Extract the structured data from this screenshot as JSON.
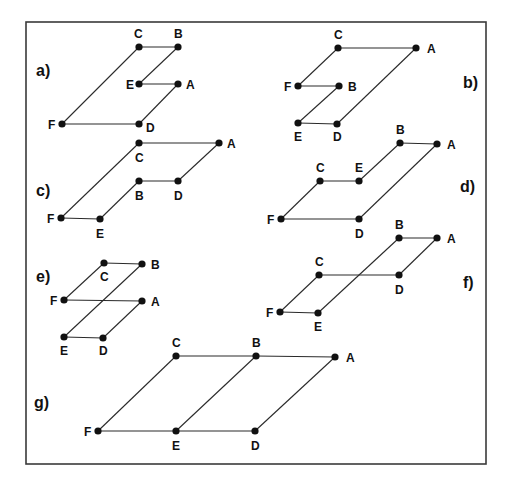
{
  "figure": {
    "frame": {
      "x": 26,
      "y": 22,
      "width": 460,
      "height": 442
    },
    "panels": [
      {
        "id": "a",
        "label": "a)",
        "label_pos": [
          36,
          76
        ],
        "nodes": [
          {
            "id": "C",
            "x": 139,
            "y": 47,
            "lx": 134,
            "ly": 38
          },
          {
            "id": "B",
            "x": 178,
            "y": 47,
            "lx": 174,
            "ly": 38
          },
          {
            "id": "E",
            "x": 139,
            "y": 84,
            "lx": 126,
            "ly": 89
          },
          {
            "id": "A",
            "x": 178,
            "y": 84,
            "lx": 186,
            "ly": 89
          },
          {
            "id": "F",
            "x": 62,
            "y": 124,
            "lx": 48,
            "ly": 129
          },
          {
            "id": "D",
            "x": 139,
            "y": 124,
            "lx": 146,
            "ly": 132
          }
        ],
        "edges": [
          [
            "C",
            "B"
          ],
          [
            "B",
            "E"
          ],
          [
            "E",
            "A"
          ],
          [
            "A",
            "D"
          ],
          [
            "F",
            "D"
          ],
          [
            "F",
            "C"
          ]
        ]
      },
      {
        "id": "b",
        "label": "b)",
        "label_pos": [
          463,
          88
        ],
        "nodes": [
          {
            "id": "C",
            "x": 338,
            "y": 48,
            "lx": 334,
            "ly": 39
          },
          {
            "id": "A",
            "x": 416,
            "y": 48,
            "lx": 427,
            "ly": 53
          },
          {
            "id": "F",
            "x": 298,
            "y": 86,
            "lx": 284,
            "ly": 91
          },
          {
            "id": "B",
            "x": 339,
            "y": 86,
            "lx": 348,
            "ly": 91
          },
          {
            "id": "E",
            "x": 298,
            "y": 123,
            "lx": 294,
            "ly": 141
          },
          {
            "id": "D",
            "x": 337,
            "y": 124,
            "lx": 333,
            "ly": 141
          }
        ],
        "edges": [
          [
            "C",
            "A"
          ],
          [
            "F",
            "C"
          ],
          [
            "F",
            "B"
          ],
          [
            "B",
            "E"
          ],
          [
            "E",
            "D"
          ],
          [
            "D",
            "A"
          ]
        ]
      },
      {
        "id": "c",
        "label": "c)",
        "label_pos": [
          36,
          196
        ],
        "nodes": [
          {
            "id": "C",
            "x": 139,
            "y": 143,
            "lx": 135,
            "ly": 162
          },
          {
            "id": "A",
            "x": 219,
            "y": 143,
            "lx": 227,
            "ly": 148
          },
          {
            "id": "B",
            "x": 139,
            "y": 181,
            "lx": 135,
            "ly": 200
          },
          {
            "id": "D",
            "x": 178,
            "y": 181,
            "lx": 174,
            "ly": 200
          },
          {
            "id": "F",
            "x": 61,
            "y": 218,
            "lx": 47,
            "ly": 223
          },
          {
            "id": "E",
            "x": 100,
            "y": 219,
            "lx": 96,
            "ly": 238
          }
        ],
        "edges": [
          [
            "C",
            "A"
          ],
          [
            "F",
            "C"
          ],
          [
            "B",
            "D"
          ],
          [
            "D",
            "A"
          ],
          [
            "F",
            "E"
          ],
          [
            "E",
            "B"
          ]
        ]
      },
      {
        "id": "d",
        "label": "d)",
        "label_pos": [
          460,
          192
        ],
        "nodes": [
          {
            "id": "B",
            "x": 400,
            "y": 143,
            "lx": 396,
            "ly": 134
          },
          {
            "id": "A",
            "x": 437,
            "y": 144,
            "lx": 447,
            "ly": 149
          },
          {
            "id": "C",
            "x": 320,
            "y": 181,
            "lx": 316,
            "ly": 172
          },
          {
            "id": "E",
            "x": 359,
            "y": 181,
            "lx": 355,
            "ly": 172
          },
          {
            "id": "F",
            "x": 281,
            "y": 219,
            "lx": 267,
            "ly": 224
          },
          {
            "id": "D",
            "x": 359,
            "y": 219,
            "lx": 355,
            "ly": 238
          }
        ],
        "edges": [
          [
            "B",
            "A"
          ],
          [
            "C",
            "E"
          ],
          [
            "E",
            "B"
          ],
          [
            "F",
            "C"
          ],
          [
            "F",
            "D"
          ],
          [
            "D",
            "A"
          ]
        ]
      },
      {
        "id": "e",
        "label": "e)",
        "label_pos": [
          36,
          282
        ],
        "nodes": [
          {
            "id": "C",
            "x": 104,
            "y": 263,
            "lx": 100,
            "ly": 281
          },
          {
            "id": "B",
            "x": 142,
            "y": 264,
            "lx": 151,
            "ly": 269
          },
          {
            "id": "F",
            "x": 64,
            "y": 300,
            "lx": 50,
            "ly": 305
          },
          {
            "id": "A",
            "x": 142,
            "y": 301,
            "lx": 151,
            "ly": 306
          },
          {
            "id": "E",
            "x": 64,
            "y": 337,
            "lx": 60,
            "ly": 355
          },
          {
            "id": "D",
            "x": 103,
            "y": 338,
            "lx": 99,
            "ly": 355
          }
        ],
        "edges": [
          [
            "C",
            "B"
          ],
          [
            "F",
            "C"
          ],
          [
            "F",
            "A"
          ],
          [
            "B",
            "E"
          ],
          [
            "E",
            "D"
          ],
          [
            "D",
            "A"
          ]
        ]
      },
      {
        "id": "f",
        "label": "f)",
        "label_pos": [
          463,
          288
        ],
        "nodes": [
          {
            "id": "B",
            "x": 399,
            "y": 238,
            "lx": 395,
            "ly": 229
          },
          {
            "id": "A",
            "x": 437,
            "y": 238,
            "lx": 447,
            "ly": 243
          },
          {
            "id": "C",
            "x": 319,
            "y": 275,
            "lx": 315,
            "ly": 266
          },
          {
            "id": "D",
            "x": 399,
            "y": 275,
            "lx": 395,
            "ly": 294
          },
          {
            "id": "F",
            "x": 280,
            "y": 312,
            "lx": 266,
            "ly": 317
          },
          {
            "id": "E",
            "x": 318,
            "y": 313,
            "lx": 314,
            "ly": 331
          }
        ],
        "edges": [
          [
            "B",
            "A"
          ],
          [
            "A",
            "D"
          ],
          [
            "C",
            "D"
          ],
          [
            "F",
            "C"
          ],
          [
            "F",
            "E"
          ],
          [
            "E",
            "B"
          ]
        ]
      },
      {
        "id": "g",
        "label": "g)",
        "label_pos": [
          34,
          408
        ],
        "nodes": [
          {
            "id": "C",
            "x": 176,
            "y": 356,
            "lx": 172,
            "ly": 347
          },
          {
            "id": "B",
            "x": 256,
            "y": 356,
            "lx": 252,
            "ly": 347
          },
          {
            "id": "A",
            "x": 335,
            "y": 357,
            "lx": 346,
            "ly": 362
          },
          {
            "id": "F",
            "x": 98,
            "y": 431,
            "lx": 84,
            "ly": 436
          },
          {
            "id": "E",
            "x": 176,
            "y": 431,
            "lx": 172,
            "ly": 450
          },
          {
            "id": "D",
            "x": 255,
            "y": 431,
            "lx": 251,
            "ly": 450
          }
        ],
        "edges": [
          [
            "C",
            "B"
          ],
          [
            "B",
            "A"
          ],
          [
            "F",
            "C"
          ],
          [
            "E",
            "B"
          ],
          [
            "D",
            "A"
          ],
          [
            "F",
            "E"
          ],
          [
            "E",
            "D"
          ]
        ]
      }
    ]
  }
}
